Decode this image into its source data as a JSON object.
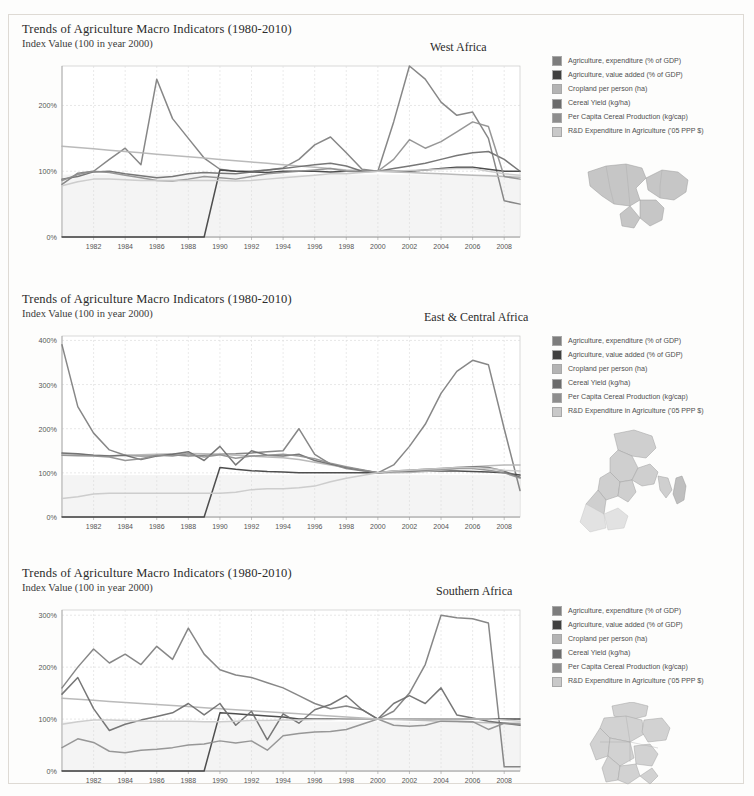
{
  "document": {
    "kind": "scanned-figure-page",
    "panel_count": 3
  },
  "legend_series": [
    {
      "label": "Agriculture, expenditure (% of GDP)",
      "color": "#7d7d7d",
      "key": "ag_expenditure"
    },
    {
      "label": "Agriculture, value added (% of GDP)",
      "color": "#3f3f3f",
      "key": "ag_value_added"
    },
    {
      "label": "Cropland per person (ha)",
      "color": "#b4b4b4",
      "key": "cropland_per_person"
    },
    {
      "label": "Cereal Yield (kg/ha)",
      "color": "#6b6b6b",
      "key": "cereal_yield"
    },
    {
      "label": "Per Capita Cereal Production (kg/cap)",
      "color": "#8e8e8e",
      "key": "per_capita_cereal"
    },
    {
      "label": "R&D Expenditure in Agriculture ('05 PPP $)",
      "color": "#c9c9c9",
      "key": "rd_expenditure"
    }
  ],
  "panels": [
    {
      "id": "west-africa",
      "title": "Trends of Agriculture Macro Indicators (1980-2010)",
      "subtitle": "Index Value (100 in year 2000)",
      "region": "West Africa",
      "map_name": "west-africa-map"
    },
    {
      "id": "east-central-africa",
      "title": "Trends of Agriculture Macro Indicators (1980-2010)",
      "subtitle": "Index Value (100 in year 2000)",
      "region": "East & Central Africa",
      "map_name": "east-central-africa-map"
    },
    {
      "id": "southern-africa",
      "title": "Trends of Agriculture Macro Indicators (1980-2010)",
      "subtitle": "Index Value (100 in year 2000)",
      "region": "Southern Africa",
      "map_name": "southern-africa-map"
    }
  ],
  "chart_data": [
    {
      "type": "line",
      "title": "Trends of Agriculture Macro Indicators (1980-2010)",
      "subtitle": "Index Value (100 in year 2000)",
      "annotation": "West Africa",
      "xlabel": "",
      "ylabel": "Index Value (100 in year 2000)",
      "grid": true,
      "legend_position": "right",
      "x": [
        1980,
        1981,
        1982,
        1983,
        1984,
        1985,
        1986,
        1987,
        1988,
        1989,
        1990,
        1991,
        1992,
        1993,
        1994,
        1995,
        1996,
        1997,
        1998,
        1999,
        2000,
        2001,
        2002,
        2003,
        2004,
        2005,
        2006,
        2007,
        2008,
        2009
      ],
      "xticks": [
        "1982",
        "1984",
        "1986",
        "1988",
        "1990",
        "1992",
        "1994",
        "1996",
        "1998",
        "2000",
        "2002",
        "2004",
        "2006",
        "2008"
      ],
      "yticks": [
        "0%",
        "100%",
        "200%"
      ],
      "ylim": [
        0,
        260
      ],
      "series": [
        {
          "name": "Agriculture, expenditure (% of GDP)",
          "color": "#7d7d7d",
          "values": [
            80,
            97,
            100,
            118,
            135,
            110,
            240,
            180,
            150,
            120,
            103,
            100,
            100,
            102,
            105,
            118,
            140,
            152,
            128,
            103,
            100,
            175,
            260,
            240,
            205,
            185,
            190,
            150,
            55,
            50
          ]
        },
        {
          "name": "Agriculture, value added (% of GDP)",
          "color": "#3f3f3f",
          "values": [
            0,
            0,
            0,
            0,
            0,
            0,
            0,
            0,
            0,
            0,
            102,
            100,
            99,
            98,
            100,
            100,
            100,
            99,
            100,
            100,
            100,
            100,
            100,
            102,
            104,
            106,
            106,
            103,
            100,
            100
          ]
        },
        {
          "name": "Cropland per person (ha)",
          "color": "#b4b4b4",
          "values": [
            138,
            136,
            134,
            132,
            130,
            128,
            126,
            124,
            122,
            120,
            118,
            116,
            114,
            112,
            110,
            108,
            106,
            104,
            102,
            101,
            100,
            99,
            98,
            97,
            96,
            95,
            94,
            93,
            92,
            91
          ]
        },
        {
          "name": "Cereal Yield (kg/ha)",
          "color": "#6b6b6b",
          "values": [
            88,
            92,
            99,
            100,
            96,
            93,
            90,
            92,
            96,
            98,
            97,
            96,
            99,
            102,
            104,
            107,
            110,
            112,
            108,
            100,
            100,
            104,
            108,
            112,
            118,
            124,
            128,
            130,
            118,
            100
          ]
        },
        {
          "name": "Per Capita Cereal Production (kg/cap)",
          "color": "#8e8e8e",
          "values": [
            86,
            95,
            100,
            98,
            94,
            90,
            86,
            85,
            88,
            92,
            90,
            88,
            92,
            96,
            98,
            100,
            102,
            104,
            100,
            99,
            100,
            118,
            148,
            135,
            145,
            160,
            175,
            168,
            92,
            88
          ]
        },
        {
          "name": "R&D Expenditure in Agriculture ('05 PPP $)",
          "color": "#c9c9c9",
          "values": [
            78,
            84,
            88,
            88,
            87,
            86,
            86,
            86,
            86,
            86,
            86,
            85,
            86,
            88,
            90,
            92,
            94,
            96,
            96,
            98,
            100,
            100,
            101,
            102,
            103,
            104,
            104,
            100,
            96,
            94
          ]
        }
      ]
    },
    {
      "type": "line",
      "title": "Trends of Agriculture Macro Indicators (1980-2010)",
      "subtitle": "Index Value (100 in year 2000)",
      "annotation": "East & Central Africa",
      "xlabel": "",
      "ylabel": "Index Value (100 in year 2000)",
      "grid": true,
      "legend_position": "right",
      "x": [
        1980,
        1981,
        1982,
        1983,
        1984,
        1985,
        1986,
        1987,
        1988,
        1989,
        1990,
        1991,
        1992,
        1993,
        1994,
        1995,
        1996,
        1997,
        1998,
        1999,
        2000,
        2001,
        2002,
        2003,
        2004,
        2005,
        2006,
        2007,
        2008,
        2009
      ],
      "xticks": [
        "1982",
        "1984",
        "1986",
        "1988",
        "1990",
        "1992",
        "1994",
        "1996",
        "1998",
        "2000",
        "2002",
        "2004",
        "2006",
        "2008"
      ],
      "yticks": [
        "0%",
        "100%",
        "200%",
        "300%",
        "400%"
      ],
      "ylim": [
        0,
        410
      ],
      "series": [
        {
          "name": "Agriculture, expenditure (% of GDP)",
          "color": "#7d7d7d",
          "values": [
            390,
            250,
            190,
            152,
            140,
            138,
            139,
            141,
            138,
            140,
            142,
            143,
            145,
            148,
            150,
            200,
            142,
            120,
            110,
            105,
            100,
            118,
            160,
            210,
            280,
            330,
            355,
            345,
            200,
            60
          ]
        },
        {
          "name": "Agriculture, value added (% of GDP)",
          "color": "#3f3f3f",
          "values": [
            0,
            0,
            0,
            0,
            0,
            0,
            0,
            0,
            0,
            0,
            112,
            108,
            105,
            103,
            102,
            100,
            100,
            100,
            100,
            100,
            100,
            102,
            103,
            104,
            104,
            104,
            103,
            102,
            100,
            95
          ]
        },
        {
          "name": "Cropland per person (ha)",
          "color": "#b4b4b4",
          "values": [
            143,
            142,
            140,
            139,
            140,
            141,
            142,
            143,
            144,
            143,
            142,
            140,
            138,
            136,
            134,
            130,
            124,
            118,
            112,
            106,
            100,
            100,
            101,
            103,
            106,
            110,
            114,
            116,
            118,
            118
          ]
        },
        {
          "name": "Cereal Yield (kg/ha)",
          "color": "#6b6b6b",
          "values": [
            145,
            143,
            140,
            138,
            140,
            130,
            138,
            142,
            148,
            128,
            160,
            118,
            150,
            140,
            138,
            142,
            128,
            120,
            112,
            106,
            100,
            104,
            106,
            108,
            110,
            112,
            114,
            112,
            104,
            90
          ]
        },
        {
          "name": "Per Capita Cereal Production (kg/cap)",
          "color": "#8e8e8e",
          "values": [
            140,
            139,
            138,
            136,
            128,
            132,
            140,
            138,
            143,
            136,
            141,
            133,
            138,
            140,
            142,
            138,
            132,
            122,
            114,
            107,
            100,
            103,
            104,
            106,
            108,
            110,
            110,
            106,
            100,
            88
          ]
        },
        {
          "name": "R&D Expenditure in Agriculture ('05 PPP $)",
          "color": "#c9c9c9",
          "values": [
            42,
            46,
            52,
            54,
            54,
            54,
            54,
            54,
            54,
            54,
            54,
            56,
            62,
            64,
            64,
            66,
            70,
            80,
            88,
            94,
            100,
            104,
            106,
            108,
            110,
            112,
            112,
            110,
            106,
            104
          ]
        }
      ]
    },
    {
      "type": "line",
      "title": "Trends of Agriculture Macro Indicators (1980-2010)",
      "subtitle": "Index Value (100 in year 2000)",
      "annotation": "Southern Africa",
      "xlabel": "",
      "ylabel": "Index Value (100 in year 2000)",
      "grid": true,
      "legend_position": "right",
      "x": [
        1980,
        1981,
        1982,
        1983,
        1984,
        1985,
        1986,
        1987,
        1988,
        1989,
        1990,
        1991,
        1992,
        1993,
        1994,
        1995,
        1996,
        1997,
        1998,
        1999,
        2000,
        2001,
        2002,
        2003,
        2004,
        2005,
        2006,
        2007,
        2008,
        2009
      ],
      "xticks": [
        "1982",
        "1984",
        "1986",
        "1988",
        "1990",
        "1992",
        "1994",
        "1996",
        "1998",
        "2000",
        "2002",
        "2004",
        "2006",
        "2008"
      ],
      "yticks": [
        "0%",
        "100%",
        "200%",
        "300%"
      ],
      "ylim": [
        0,
        310
      ],
      "series": [
        {
          "name": "Agriculture, expenditure (% of GDP)",
          "color": "#7d7d7d",
          "values": [
            160,
            200,
            235,
            208,
            225,
            205,
            240,
            215,
            275,
            225,
            195,
            185,
            180,
            170,
            160,
            145,
            130,
            120,
            125,
            118,
            100,
            115,
            150,
            205,
            300,
            295,
            293,
            285,
            8,
            8
          ]
        },
        {
          "name": "Agriculture, value added (% of GDP)",
          "color": "#3f3f3f",
          "values": [
            0,
            0,
            0,
            0,
            0,
            0,
            0,
            0,
            0,
            0,
            112,
            110,
            108,
            106,
            104,
            100,
            100,
            100,
            100,
            100,
            100,
            100,
            100,
            100,
            100,
            100,
            100,
            100,
            100,
            100
          ]
        },
        {
          "name": "Cropland per person (ha)",
          "color": "#b4b4b4",
          "values": [
            140,
            138,
            136,
            134,
            132,
            130,
            128,
            126,
            124,
            122,
            120,
            118,
            116,
            114,
            112,
            110,
            108,
            106,
            104,
            102,
            100,
            99,
            98,
            97,
            96,
            95,
            94,
            93,
            92,
            92
          ]
        },
        {
          "name": "Cereal Yield (kg/ha)",
          "color": "#6b6b6b",
          "values": [
            148,
            180,
            120,
            78,
            90,
            98,
            105,
            112,
            130,
            108,
            130,
            88,
            115,
            60,
            110,
            92,
            118,
            128,
            145,
            118,
            100,
            130,
            145,
            130,
            160,
            108,
            102,
            96,
            92,
            88
          ]
        },
        {
          "name": "Per Capita Cereal Production (kg/cap)",
          "color": "#8e8e8e",
          "values": [
            45,
            62,
            55,
            38,
            35,
            40,
            42,
            45,
            50,
            52,
            58,
            54,
            58,
            40,
            68,
            72,
            75,
            76,
            80,
            90,
            100,
            88,
            86,
            88,
            96,
            96,
            95,
            80,
            92,
            90
          ]
        },
        {
          "name": "R&D Expenditure in Agriculture ('05 PPP $)",
          "color": "#c9c9c9",
          "values": [
            90,
            95,
            98,
            98,
            97,
            96,
            96,
            96,
            96,
            95,
            95,
            96,
            97,
            97,
            98,
            98,
            99,
            99,
            100,
            100,
            100,
            100,
            100,
            100,
            100,
            100,
            100,
            100,
            98,
            96
          ]
        }
      ]
    }
  ]
}
